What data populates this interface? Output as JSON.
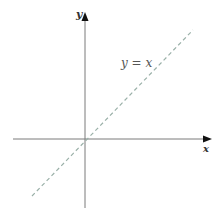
{
  "diagram": {
    "title": "",
    "axes": {
      "x_label": "x",
      "y_label": "y"
    },
    "line_label": "y = x",
    "colors": {
      "axis": "#7a7a7a",
      "line": "#9ab0a8",
      "arrow": "#111111"
    }
  }
}
